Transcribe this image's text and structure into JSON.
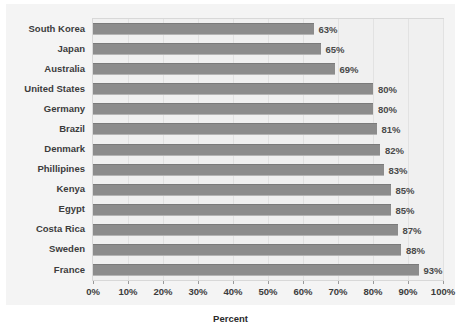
{
  "chart_data": {
    "type": "bar",
    "orientation": "horizontal",
    "title": "",
    "xlabel": "Percent",
    "ylabel": "",
    "xlim": [
      0,
      100
    ],
    "xticks": [
      "0%",
      "10%",
      "20%",
      "30%",
      "40%",
      "50%",
      "60%",
      "70%",
      "80%",
      "90%",
      "100%"
    ],
    "xtick_values": [
      0,
      10,
      20,
      30,
      40,
      50,
      60,
      70,
      80,
      90,
      100
    ],
    "grid": true,
    "legend": "none",
    "categories": [
      "South Korea",
      "Japan",
      "Australia",
      "United States",
      "Germany",
      "Brazil",
      "Denmark",
      "Phillipines",
      "Kenya",
      "Egypt",
      "Costa Rica",
      "Sweden",
      "France"
    ],
    "values": [
      63,
      65,
      69,
      80,
      80,
      81,
      82,
      83,
      85,
      85,
      87,
      88,
      93
    ],
    "data_labels": [
      "63%",
      "65%",
      "69%",
      "80%",
      "80%",
      "81%",
      "82%",
      "83%",
      "85%",
      "85%",
      "87%",
      "88%",
      "93%"
    ],
    "bar_color": "#8c8c8c",
    "plot_background": "#f0f0f0",
    "panel_background": "#f4f4f4",
    "text_color": "#3c3c3c"
  }
}
